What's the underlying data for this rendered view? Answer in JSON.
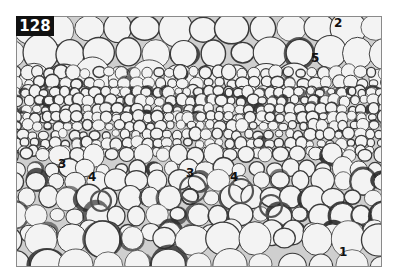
{
  "figure": {
    "number": "128",
    "colors": {
      "background": "#ffffff",
      "frame": "#8a8a8a",
      "cell_fill": "#f3f3f3",
      "cell_wall": "#3a3a3a",
      "dark_band": "#2b2b2b",
      "label_box": "#111111"
    }
  },
  "labels": [
    {
      "text": "2",
      "x": 334,
      "y": 17
    },
    {
      "text": "5",
      "x": 311,
      "y": 52
    },
    {
      "text": "3",
      "x": 58,
      "y": 158
    },
    {
      "text": "4",
      "x": 88,
      "y": 171
    },
    {
      "text": "3",
      "x": 186,
      "y": 167
    },
    {
      "text": "4",
      "x": 230,
      "y": 171
    },
    {
      "text": "1",
      "x": 339,
      "y": 246
    }
  ]
}
